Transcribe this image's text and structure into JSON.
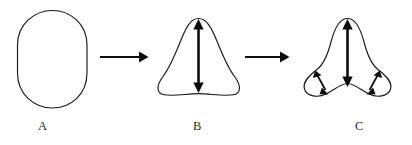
{
  "figure": {
    "background_color": "#ffffff",
    "stroke_color": "#1a1a1a",
    "arrow_color": "#0d0d0d"
  },
  "stages": [
    {
      "id": "stage-a",
      "label": "A",
      "shape": "oval",
      "arrows": []
    },
    {
      "id": "stage-b",
      "label": "B",
      "shape": "rounded-triangle",
      "arrows": [
        {
          "id": "b-vertical",
          "kind": "double-headed",
          "orientation": "vertical"
        }
      ]
    },
    {
      "id": "stage-c",
      "label": "C",
      "shape": "trefoil",
      "arrows": [
        {
          "id": "c-vertical",
          "kind": "double-headed",
          "orientation": "vertical"
        },
        {
          "id": "c-left-lobe",
          "kind": "double-headed",
          "orientation": "diagonal"
        },
        {
          "id": "c-right-lobe",
          "kind": "double-headed",
          "orientation": "diagonal"
        }
      ]
    }
  ],
  "transitions": [
    {
      "id": "arrow-a-to-b",
      "from": "A",
      "to": "B",
      "kind": "single-headed",
      "direction": "right"
    },
    {
      "id": "arrow-b-to-c",
      "from": "B",
      "to": "C",
      "kind": "single-headed",
      "direction": "right"
    }
  ]
}
